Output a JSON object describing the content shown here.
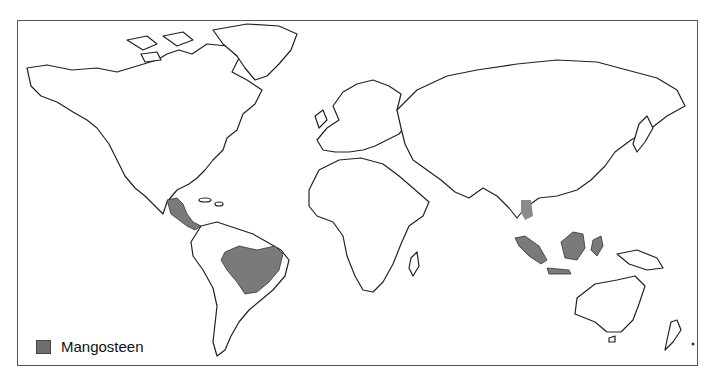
{
  "map": {
    "type": "world-distribution-map",
    "shaded_color": "#7a7a7a",
    "shaded_regions": [
      {
        "name": "Central America",
        "label": "central-america-region"
      },
      {
        "name": "Amazon Basin / Brazil",
        "label": "brazil-region"
      },
      {
        "name": "Indochina",
        "label": "indochina-region"
      },
      {
        "name": "Sumatra",
        "label": "sumatra-region"
      },
      {
        "name": "Borneo",
        "label": "borneo-region"
      },
      {
        "name": "Sulawesi",
        "label": "sulawesi-region"
      },
      {
        "name": "Java",
        "label": "java-region"
      }
    ]
  },
  "legend": {
    "items": [
      {
        "label": "Mangosteen",
        "color": "#6e6e6e"
      }
    ]
  }
}
